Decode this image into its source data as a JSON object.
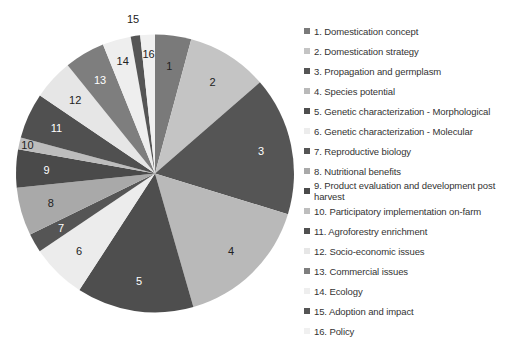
{
  "chart_data": {
    "type": "pie",
    "title": "",
    "start_angle_deg": 0,
    "direction": "clockwise",
    "legend_position": "right",
    "slices": [
      {
        "label": "1",
        "name": "1. Domestication concept",
        "value": 4.2,
        "color": "#7a7a7a",
        "text_color": "#222222"
      },
      {
        "label": "2",
        "name": "2. Domestication strategy",
        "value": 9.4,
        "color": "#c4c4c4",
        "text_color": "#222222"
      },
      {
        "label": "3",
        "name": "3. Propagation and germplasm",
        "value": 16.1,
        "color": "#555555",
        "text_color": "#ffffff"
      },
      {
        "label": "4",
        "name": "4. Species potential",
        "value": 15.8,
        "color": "#b9b9b9",
        "text_color": "#222222"
      },
      {
        "label": "5",
        "name": "5. Genetic characterization - Morphological",
        "value": 13.6,
        "color": "#4e4e4e",
        "text_color": "#ffffff"
      },
      {
        "label": "6",
        "name": "6. Genetic characterization - Molecular",
        "value": 6.4,
        "color": "#ececec",
        "text_color": "#222222"
      },
      {
        "label": "7",
        "name": "7. Reproductive biology",
        "value": 2.2,
        "color": "#555555",
        "text_color": "#ffffff"
      },
      {
        "label": "8",
        "name": "8. Nutritional benefits",
        "value": 5.6,
        "color": "#a9a9a9",
        "text_color": "#222222"
      },
      {
        "label": "9",
        "name": "9. Product evaluation and development post harvest",
        "value": 4.4,
        "color": "#4a4a4a",
        "text_color": "#ffffff"
      },
      {
        "label": "10",
        "name": "10. Participatory implementation on-farm",
        "value": 1.4,
        "color": "#bdbdbd",
        "text_color": "#222222"
      },
      {
        "label": "11",
        "name": "11. Agroforestry enrichment",
        "value": 5.3,
        "color": "#505050",
        "text_color": "#ffffff"
      },
      {
        "label": "12",
        "name": "12. Socio-economic issues",
        "value": 4.7,
        "color": "#e6e6e6",
        "text_color": "#222222"
      },
      {
        "label": "13",
        "name": "13. Commercial issues",
        "value": 4.7,
        "color": "#7e7e7e",
        "text_color": "#ffffff"
      },
      {
        "label": "14",
        "name": "14. Ecology",
        "value": 3.3,
        "color": "#eeeeee",
        "text_color": "#222222"
      },
      {
        "label": "15",
        "name": "15. Adoption and impact",
        "value": 1.1,
        "color": "#555555",
        "text_color": "#222222"
      },
      {
        "label": "16",
        "name": "16. Policy",
        "value": 1.7,
        "color": "#f0f0f0",
        "text_color": "#222222"
      }
    ]
  }
}
